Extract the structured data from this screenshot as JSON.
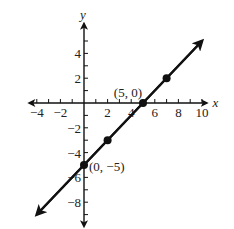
{
  "chart_data": {
    "type": "line",
    "title": "",
    "xlabel": "x",
    "ylabel": "y",
    "xlim": [
      -5,
      11
    ],
    "ylim": [
      -9,
      6
    ],
    "grid": false,
    "x_ticks": [
      -4,
      -2,
      2,
      4,
      6,
      8,
      10
    ],
    "y_ticks": [
      4,
      2,
      -2,
      -4,
      -6,
      -8
    ],
    "x_tick_labels": [
      "−4",
      "−2",
      "2",
      "4",
      "6",
      "8",
      "10"
    ],
    "y_tick_labels": [
      "4",
      "2",
      "−2",
      "−4",
      "−6",
      "−8"
    ],
    "series": [
      {
        "name": "y = x − 5",
        "slope": 1,
        "intercept": -5,
        "line_start": [
          -4,
          -9
        ],
        "line_end": [
          10,
          5
        ],
        "points": [
          {
            "x": 0,
            "y": -5
          },
          {
            "x": 2,
            "y": -3
          },
          {
            "x": 5,
            "y": 0
          },
          {
            "x": 7,
            "y": 2
          }
        ]
      }
    ],
    "annotations": [
      {
        "text": "(5, 0)",
        "x": 5,
        "y": 0
      },
      {
        "text": "(0, −5)",
        "x": 0,
        "y": -5
      }
    ]
  }
}
